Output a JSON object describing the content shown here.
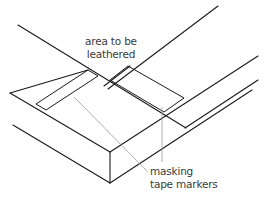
{
  "figure": {
    "type": "isometric line drawing",
    "line_color": "#1a1a1a",
    "leader_color": "#9a9a9a",
    "background": "#ffffff"
  },
  "labels": {
    "area_to_be_leathered": {
      "line1": "area to be",
      "line2": "leathered"
    },
    "masking_tape_markers": {
      "line1": "masking",
      "line2": "tape markers"
    }
  }
}
